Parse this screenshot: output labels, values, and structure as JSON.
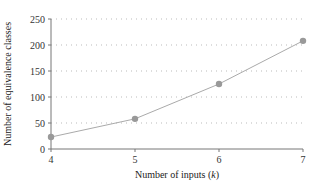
{
  "chart_data": {
    "type": "line",
    "title": "",
    "xlabel": "Number of inputs (k)",
    "ylabel": "Number of equivalence classes",
    "x": [
      4,
      5,
      6,
      7
    ],
    "series": [
      {
        "name": "Equivalence classes",
        "values": [
          23,
          58,
          125,
          208
        ],
        "color": "#999999"
      }
    ],
    "xlim": [
      4,
      7
    ],
    "ylim": [
      0,
      250
    ],
    "xticks": [
      4,
      5,
      6,
      7
    ],
    "yticks": [
      0,
      50,
      100,
      150,
      200,
      250
    ],
    "grid": "horizontal dotted",
    "legend": "none"
  },
  "axes": {
    "xlabel_prefix": "Number of inputs (",
    "xlabel_var": "k",
    "xlabel_suffix": ")",
    "ylabel": "Number of equivalence classes"
  }
}
